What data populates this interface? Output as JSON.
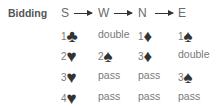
{
  "title": "Bidding",
  "players": [
    "S",
    "W",
    "N",
    "E"
  ],
  "suits": {
    "clubs": "♣",
    "diamonds": "♦",
    "hearts": "♥",
    "spades": "♠"
  },
  "rows": [
    [
      {
        "level": "1",
        "suit": "♣",
        "suit_name": "clubs"
      },
      {
        "text": "double"
      },
      {
        "level": "1",
        "suit": "♦",
        "suit_name": "diamonds"
      },
      {
        "level": "1",
        "suit": "♠",
        "suit_name": "spades"
      }
    ],
    [
      {
        "level": "2",
        "suit": "♥",
        "suit_name": "hearts"
      },
      {
        "level": "2",
        "suit": "♠",
        "suit_name": "spades"
      },
      {
        "level": "3",
        "suit": "♦",
        "suit_name": "diamonds"
      },
      {
        "text": "double"
      }
    ],
    [
      {
        "level": "3",
        "suit": "♥",
        "suit_name": "hearts"
      },
      {
        "text": "pass"
      },
      {
        "text": "pass"
      },
      {
        "level": "3",
        "suit": "♠",
        "suit_name": "spades"
      }
    ],
    [
      {
        "level": "4",
        "suit": "♥",
        "suit_name": "hearts"
      },
      {
        "text": "pass"
      },
      {
        "text": "pass"
      },
      {
        "text": "pass"
      }
    ]
  ]
}
